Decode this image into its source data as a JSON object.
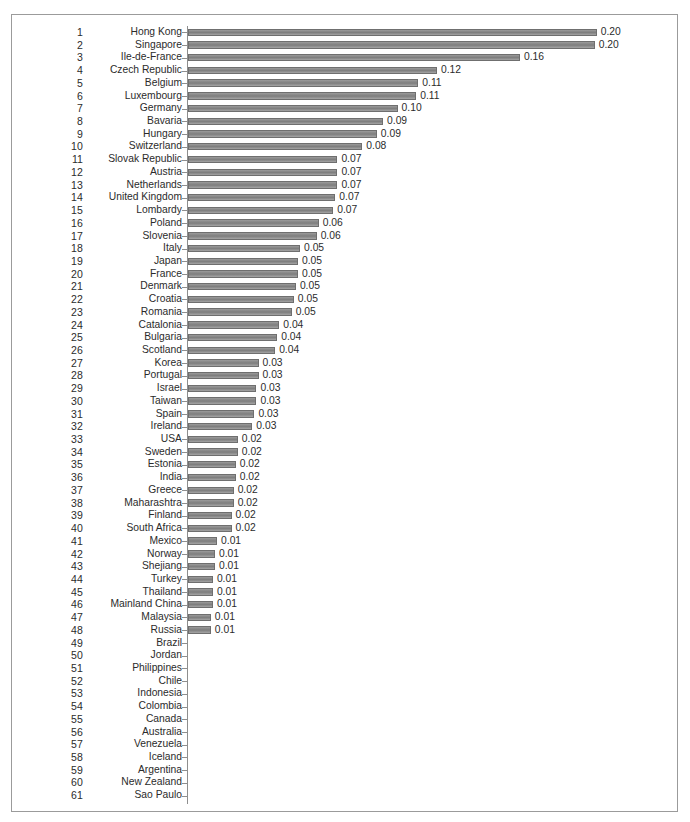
{
  "figure": {
    "frame_color": "#9b9b9b",
    "background": "#ffffff",
    "bar_color": "#8a8a8a",
    "text_color": "#2b2b2b"
  },
  "chart_data": {
    "type": "bar",
    "orientation": "horizontal",
    "title": "",
    "subtitle": "",
    "xlabel": "",
    "ylabel": "",
    "grid": false,
    "legend": false,
    "value_format": "0.00",
    "xlim": [
      0,
      0.21
    ],
    "categories": [
      "Hong Kong",
      "Singapore",
      "Ile-de-France",
      "Czech Republic",
      "Belgium",
      "Luxembourg",
      "Germany",
      "Bavaria",
      "Hungary",
      "Switzerland",
      "Slovak Republic",
      "Austria",
      "Netherlands",
      "United Kingdom",
      "Lombardy",
      "Poland",
      "Slovenia",
      "Italy",
      "Japan",
      "France",
      "Denmark",
      "Croatia",
      "Romania",
      "Catalonia",
      "Bulgaria",
      "Scotland",
      "Korea",
      "Portugal",
      "Israel",
      "Taiwan",
      "Spain",
      "Ireland",
      "USA",
      "Sweden",
      "Estonia",
      "India",
      "Greece",
      "Maharashtra",
      "Finland",
      "South Africa",
      "Mexico",
      "Norway",
      "Shejiang",
      "Turkey",
      "Thailand",
      "Mainland China",
      "Malaysia",
      "Russia",
      "Brazil",
      "Jordan",
      "Philippines",
      "Chile",
      "Indonesia",
      "Colombia",
      "Canada",
      "Australia",
      "Venezuela",
      "Iceland",
      "Argentina",
      "New Zealand",
      "Sao Paulo"
    ],
    "ranks": [
      "1",
      "2",
      "3",
      "4",
      "5",
      "6",
      "7",
      "8",
      "9",
      "10",
      "11",
      "12",
      "13",
      "14",
      "15",
      "16",
      "17",
      "18",
      "19",
      "20",
      "21",
      "22",
      "23",
      "24",
      "25",
      "26",
      "27",
      "28",
      "29",
      "30",
      "31",
      "32",
      "33",
      "34",
      "35",
      "36",
      "37",
      "38",
      "39",
      "40",
      "41",
      "42",
      "43",
      "44",
      "45",
      "46",
      "47",
      "48",
      "49",
      "50",
      "51",
      "52",
      "53",
      "54",
      "55",
      "56",
      "57",
      "58",
      "59",
      "60",
      "61"
    ],
    "values": [
      0.197,
      0.196,
      0.16,
      0.12,
      0.111,
      0.11,
      0.101,
      0.094,
      0.091,
      0.084,
      0.072,
      0.072,
      0.072,
      0.071,
      0.07,
      0.063,
      0.062,
      0.054,
      0.053,
      0.053,
      0.052,
      0.051,
      0.05,
      0.044,
      0.043,
      0.042,
      0.034,
      0.034,
      0.033,
      0.033,
      0.032,
      0.031,
      0.024,
      0.024,
      0.023,
      0.023,
      0.022,
      0.022,
      0.021,
      0.021,
      0.014,
      0.013,
      0.013,
      0.012,
      0.012,
      0.012,
      0.011,
      0.011,
      0.0,
      0.0,
      0.0,
      0.0,
      0.0,
      0.0,
      0.0,
      0.0,
      0.0,
      0.0,
      0.0,
      0.0,
      0.0
    ],
    "value_labels": [
      "0.20",
      "0.20",
      "0.16",
      "0.12",
      "0.11",
      "0.11",
      "0.10",
      "0.09",
      "0.09",
      "0.08",
      "0.07",
      "0.07",
      "0.07",
      "0.07",
      "0.07",
      "0.06",
      "0.06",
      "0.05",
      "0.05",
      "0.05",
      "0.05",
      "0.05",
      "0.05",
      "0.04",
      "0.04",
      "0.04",
      "0.03",
      "0.03",
      "0.03",
      "0.03",
      "0.03",
      "0.03",
      "0.02",
      "0.02",
      "0.02",
      "0.02",
      "0.02",
      "0.02",
      "0.02",
      "0.02",
      "0.01",
      "0.01",
      "0.01",
      "0.01",
      "0.01",
      "0.01",
      "0.01",
      "0.01",
      "",
      "",
      "",
      "",
      "",
      "",
      "",
      "",
      "",
      "",
      "",
      "",
      ""
    ]
  }
}
